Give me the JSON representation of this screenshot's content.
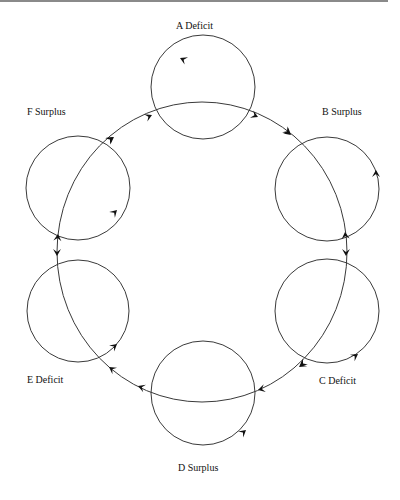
{
  "diagram": {
    "type": "circular flow of six economies",
    "nodes": [
      {
        "id": "A",
        "label": "A  Deficit",
        "status": "Deficit",
        "cx": 203,
        "cy": 87,
        "r": 52
      },
      {
        "id": "B",
        "label": "B  Surplus",
        "status": "Surplus",
        "cx": 327,
        "cy": 189,
        "r": 52
      },
      {
        "id": "C",
        "label": "C  Deficit",
        "status": "Deficit",
        "cx": 327,
        "cy": 311,
        "r": 52
      },
      {
        "id": "D",
        "label": "D  Surplus",
        "status": "Surplus",
        "cx": 203,
        "cy": 393,
        "r": 52
      },
      {
        "id": "E",
        "label": "E  Deficit",
        "status": "Deficit",
        "cx": 78,
        "cy": 311,
        "r": 51
      },
      {
        "id": "F",
        "label": "F  Surplus",
        "status": "Surplus",
        "cx": 78,
        "cy": 188,
        "r": 52
      }
    ],
    "ring": {
      "cx": 202,
      "cy": 252,
      "rx": 145,
      "ry": 150
    },
    "colors": {
      "stroke": "#3a3a3a",
      "arrow": "#111111",
      "background": "#ffffff"
    }
  }
}
